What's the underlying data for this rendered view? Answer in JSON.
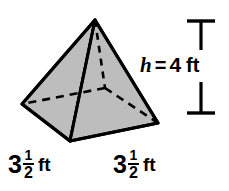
{
  "figure": {
    "type": "square-pyramid-diagram",
    "shape_name": "square pyramid",
    "fill_color": "#bdbdbd",
    "stroke_color": "#000000",
    "background_color": "#ffffff",
    "vertices": {
      "apex": [
        95,
        20
      ],
      "base_left": [
        22,
        104
      ],
      "base_front": [
        70,
        141
      ],
      "base_right": [
        158,
        123
      ],
      "base_back_hidden": [
        105,
        88
      ]
    },
    "hidden_edges_style": "dashed"
  },
  "height_annotation": {
    "variable": "h",
    "equals": "=",
    "value": "4",
    "unit": "ft",
    "full_text": "h = 4 ft",
    "bar_top_y": 20,
    "bar_bottom_y": 113,
    "bar_x": 201,
    "cap_half_width": 14
  },
  "base_labels": [
    {
      "name": "base-edge-left",
      "whole": "3",
      "numerator": "1",
      "denominator": "2",
      "unit": "ft",
      "full_text": "3 1/2 ft"
    },
    {
      "name": "base-edge-right",
      "whole": "3",
      "numerator": "1",
      "denominator": "2",
      "unit": "ft",
      "full_text": "3 1/2 ft"
    }
  ]
}
